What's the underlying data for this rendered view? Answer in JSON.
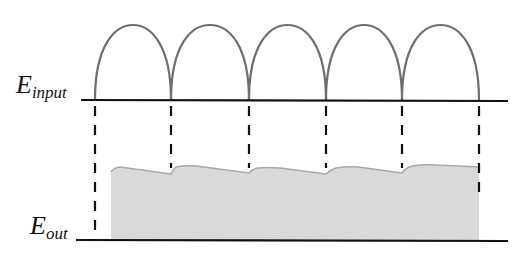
{
  "labels": {
    "input": {
      "main": "E",
      "sub": "input"
    },
    "output": {
      "main": "E",
      "sub": "out"
    }
  },
  "colors": {
    "arc": "#6e6e6e",
    "baseline": "#111111",
    "dash": "#111111",
    "fill": "#d9d9d9",
    "fill_edge": "#a8a8a8",
    "background": "#ffffff"
  },
  "geometry": {
    "input_baseline_y": 100,
    "output_baseline_y": 240,
    "baseline_x_start": 80,
    "baseline_x_end": 508,
    "arc_boundaries_x": [
      95,
      171,
      249,
      326,
      402,
      479
    ],
    "arc_peak_y": 25,
    "dash_top_y": 106,
    "fill_left_x": 111,
    "fill_right_x": 479
  },
  "diagram": {
    "input_humps": 5
  }
}
